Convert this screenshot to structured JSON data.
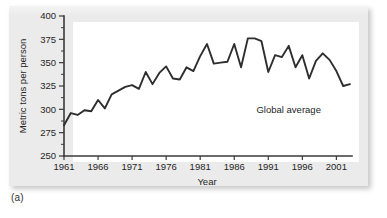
{
  "figure": {
    "panel_caption": "(a)",
    "annotation": "Global average",
    "colors": {
      "card_background": "#ebebeb",
      "plot_background": "#ffffff",
      "line": "#2e2e2e",
      "axis": "#3a3a3a",
      "text": "#252525"
    }
  },
  "chart_data": {
    "type": "line",
    "title": "",
    "subtitle": "",
    "xlabel": "Year",
    "ylabel": "Metric tons per person",
    "xlim": [
      1961,
      2003
    ],
    "ylim": [
      250,
      400
    ],
    "ytick_labels": [
      "250",
      "275",
      "300",
      "325",
      "350",
      "375",
      "400"
    ],
    "yticks": [
      250,
      275,
      300,
      325,
      350,
      375,
      400
    ],
    "y_minor_tick_step": 12.5,
    "xtick_labels": [
      "1961",
      "1966",
      "1971",
      "1976",
      "1981",
      "1986",
      "1991",
      "1996",
      "2001"
    ],
    "xticks": [
      1961,
      1966,
      1971,
      1976,
      1981,
      1986,
      1991,
      1996,
      2001
    ],
    "grid": false,
    "legend": "none",
    "annotations": [
      {
        "text": "Global average",
        "x": 1994,
        "y": 296
      }
    ],
    "series": [
      {
        "name": "Global average",
        "x": [
          1961,
          1962,
          1963,
          1964,
          1965,
          1966,
          1967,
          1968,
          1969,
          1970,
          1971,
          1972,
          1973,
          1974,
          1975,
          1976,
          1977,
          1978,
          1979,
          1980,
          1981,
          1982,
          1983,
          1984,
          1985,
          1986,
          1987,
          1988,
          1989,
          1990,
          1991,
          1992,
          1993,
          1994,
          1995,
          1996,
          1997,
          1998,
          1999,
          2000,
          2001,
          2002,
          2003
        ],
        "values": [
          283,
          296,
          294,
          299,
          298,
          310,
          301,
          316,
          320,
          324,
          326,
          322,
          340,
          327,
          339,
          346,
          333,
          332,
          345,
          341,
          357,
          370,
          349,
          350,
          351,
          370,
          345,
          376,
          376,
          373,
          340,
          358,
          356,
          368,
          345,
          358,
          333,
          352,
          360,
          353,
          341,
          325,
          327
        ]
      }
    ]
  }
}
